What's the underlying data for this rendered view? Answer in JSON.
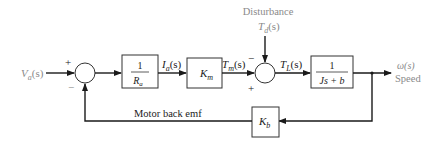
{
  "diagram": {
    "type": "block-diagram",
    "input": {
      "label": "V",
      "sub": "a",
      "suffix": "(s)"
    },
    "sum1": {
      "plus": "+",
      "minus": "−"
    },
    "block_ra": {
      "num": "1",
      "den": "R",
      "den_sub": "a"
    },
    "signal_ia": {
      "label": "I",
      "sub": "a",
      "suffix": "(s)"
    },
    "block_km": {
      "label": "K",
      "sub": "m"
    },
    "signal_tm": {
      "label": "T",
      "sub": "m",
      "suffix": "(s)"
    },
    "disturbance": {
      "title": "Disturbance",
      "label": "T",
      "sub": "d",
      "suffix": "(s)"
    },
    "sum2": {
      "plus": "+",
      "minus": "−"
    },
    "signal_tl": {
      "label": "T",
      "sub": "L",
      "suffix": "(s)"
    },
    "block_plant": {
      "num": "1",
      "den": "Js + b"
    },
    "output": {
      "label": "ω(s)",
      "caption": "Speed"
    },
    "block_kb": {
      "label": "K",
      "sub": "b"
    },
    "feedback_label": "Motor back emf"
  }
}
